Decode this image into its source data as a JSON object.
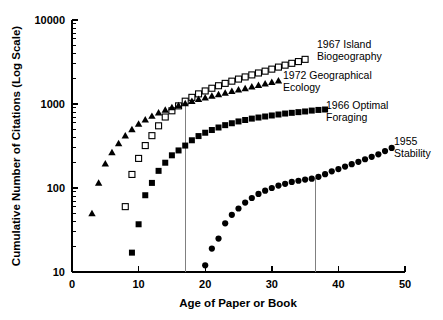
{
  "chart_data": {
    "type": "scatter",
    "title": "",
    "xlabel": "Age of Paper or Book",
    "ylabel": "Cumulative Number of Citations (Log Scale)",
    "xlim": [
      0,
      50
    ],
    "ylim": [
      10,
      10000
    ],
    "yscale": "log",
    "grid": false,
    "legend_position": "inline-right-annotations",
    "xticks": [
      "0",
      "10",
      "20",
      "30",
      "40",
      "50"
    ],
    "xtick_values": [
      0,
      10,
      20,
      30,
      40,
      50
    ],
    "yticks": [
      "10",
      "100",
      "1000",
      "10000"
    ],
    "ytick_values": [
      10,
      100,
      1000,
      10000
    ],
    "annotations": [
      {
        "name": "vertical-reference-line-1",
        "x": 17.0,
        "y_top": 1150,
        "y_bottom": 10,
        "color": "#808080"
      },
      {
        "name": "vertical-reference-line-2",
        "x": 36.5,
        "y_top": 130,
        "y_bottom": 10,
        "color": "#808080"
      }
    ],
    "series": [
      {
        "name": "1967 Island Biogeography",
        "label_lines": [
          "1967 Island",
          "Biogeography"
        ],
        "marker": "open-square",
        "color": "#000000",
        "x": [
          8,
          9,
          10,
          11,
          12,
          13,
          14,
          15,
          16,
          17,
          18,
          19,
          20,
          21,
          22,
          23,
          24,
          25,
          26,
          27,
          28,
          29,
          30,
          31,
          32,
          33,
          34,
          35
        ],
        "y": [
          60,
          145,
          225,
          320,
          420,
          550,
          700,
          830,
          950,
          1080,
          1200,
          1320,
          1430,
          1540,
          1650,
          1760,
          1870,
          1980,
          2100,
          2220,
          2340,
          2460,
          2600,
          2750,
          2900,
          3050,
          3200,
          3400
        ]
      },
      {
        "name": "1972 Geographical Ecology",
        "label_lines": [
          "1972 Geographical",
          "Ecology"
        ],
        "marker": "filled-triangle",
        "color": "#000000",
        "x": [
          3,
          4,
          5,
          6,
          7,
          8,
          9,
          10,
          11,
          12,
          13,
          14,
          15,
          16,
          17,
          18,
          19,
          20,
          21,
          22,
          23,
          24,
          25,
          26,
          27,
          28,
          29,
          30,
          31
        ],
        "y": [
          50,
          115,
          195,
          265,
          340,
          420,
          500,
          580,
          650,
          720,
          790,
          850,
          910,
          965,
          1020,
          1080,
          1140,
          1190,
          1250,
          1300,
          1360,
          1420,
          1480,
          1540,
          1610,
          1680,
          1750,
          1820,
          1900
        ]
      },
      {
        "name": "1966 Optimal Foraging",
        "label_lines": [
          "1966 Optimal",
          "Foraging"
        ],
        "marker": "filled-square",
        "color": "#000000",
        "x": [
          9,
          10,
          11,
          12,
          13,
          14,
          15,
          16,
          17,
          18,
          19,
          20,
          21,
          22,
          23,
          24,
          25,
          26,
          27,
          28,
          29,
          30,
          31,
          32,
          33,
          34,
          35,
          36,
          37,
          38
        ],
        "y": [
          17,
          37,
          82,
          115,
          160,
          200,
          245,
          280,
          320,
          370,
          415,
          455,
          490,
          525,
          560,
          590,
          620,
          645,
          670,
          690,
          710,
          730,
          750,
          770,
          785,
          800,
          815,
          835,
          850,
          860
        ]
      },
      {
        "name": "1955 Stability",
        "label_lines": [
          "1955",
          "Stability"
        ],
        "marker": "filled-circle",
        "color": "#000000",
        "x": [
          20,
          21,
          22,
          23,
          24,
          25,
          26,
          27,
          28,
          29,
          30,
          31,
          32,
          33,
          34,
          35,
          36,
          37,
          38,
          39,
          40,
          41,
          42,
          43,
          44,
          45,
          46,
          47,
          48
        ],
        "y": [
          12,
          19,
          25,
          38,
          48,
          57,
          67,
          76,
          85,
          93,
          100,
          107,
          112,
          118,
          122,
          126,
          129,
          136,
          146,
          158,
          168,
          180,
          192,
          205,
          220,
          235,
          252,
          275,
          300
        ]
      }
    ]
  },
  "axes": {
    "y_title": "Cumulative Number of Citations (Log Scale)",
    "x_title": "Age of Paper or Book",
    "y_tick_labels": [
      "10000",
      "1000",
      "100",
      "10"
    ],
    "x_tick_labels": [
      "0",
      "10",
      "20",
      "30",
      "40",
      "50"
    ]
  },
  "annotations_text": {
    "island_biogeography_line1": "1967 Island",
    "island_biogeography_line2": "Biogeography",
    "geographical_ecology_line1": "1972 Geographical",
    "geographical_ecology_line2": "Ecology",
    "optimal_foraging_line1": "1966 Optimal",
    "optimal_foraging_line2": "Foraging",
    "stability_line1": "1955",
    "stability_line2": "Stability"
  }
}
